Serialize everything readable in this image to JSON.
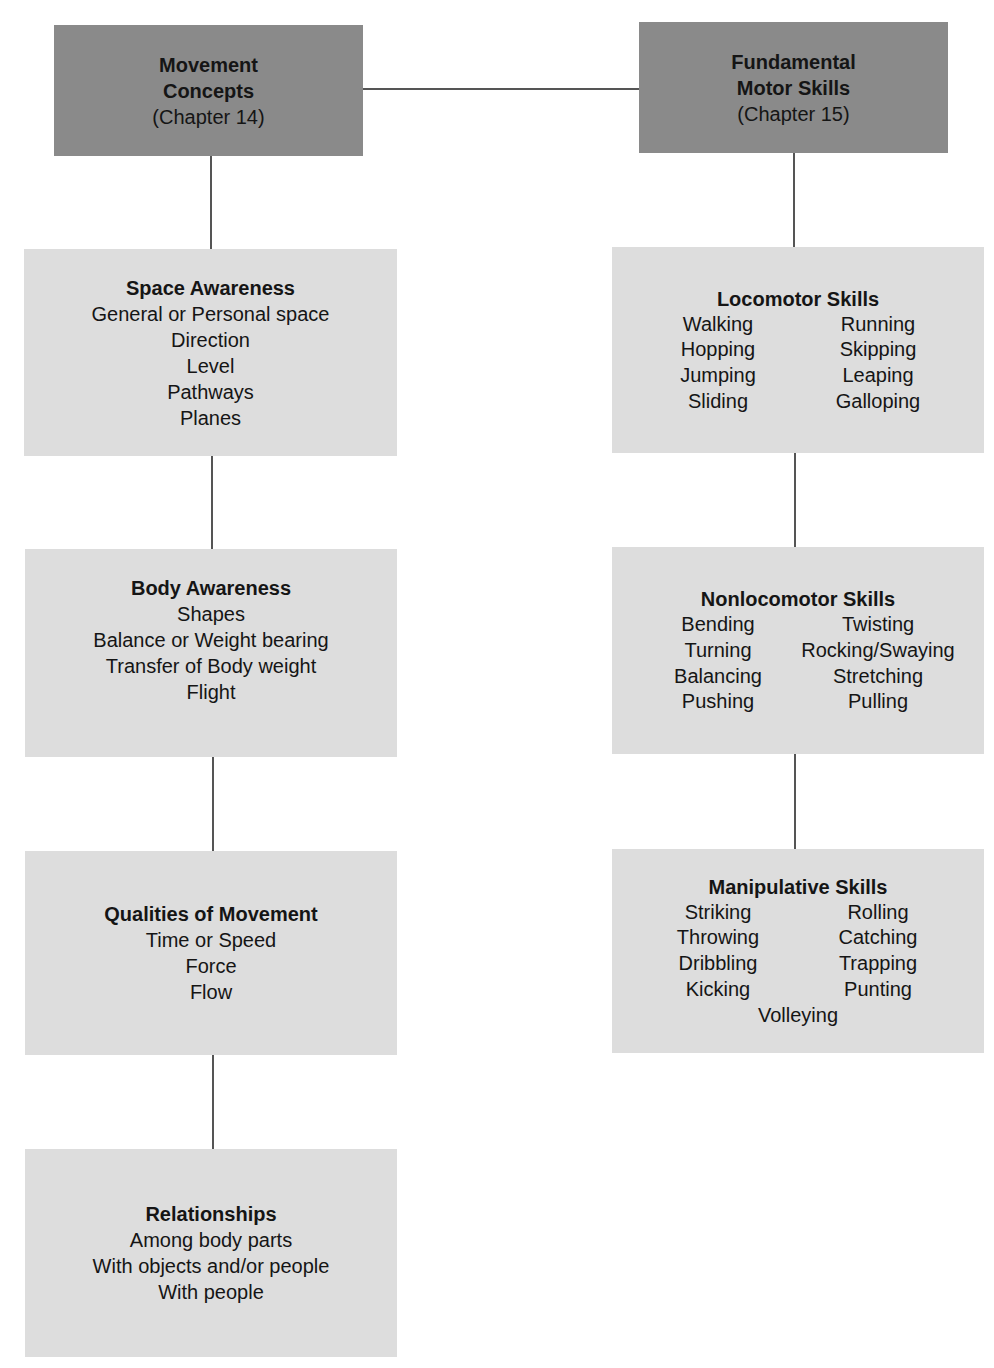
{
  "diagram": {
    "left_header": {
      "title_lines": [
        "Movement",
        "Concepts"
      ],
      "subtitle": "(Chapter 14)"
    },
    "right_header": {
      "title_lines": [
        "Fundamental",
        "Motor Skills"
      ],
      "subtitle": "(Chapter 15)"
    },
    "left_boxes": [
      {
        "title": "Space Awareness",
        "items": [
          "General or Personal space",
          "Direction",
          "Level",
          "Pathways",
          "Planes"
        ]
      },
      {
        "title": "Body Awareness",
        "items": [
          "Shapes",
          "Balance or Weight bearing",
          "Transfer of Body weight",
          "Flight"
        ]
      },
      {
        "title": "Qualities of Movement",
        "items": [
          "Time or Speed",
          "Force",
          "Flow"
        ]
      },
      {
        "title": "Relationships",
        "items": [
          "Among body parts",
          "With objects and/or people",
          "With people"
        ]
      }
    ],
    "right_boxes": [
      {
        "title": "Locomotor Skills",
        "rows": [
          [
            "Walking",
            "Running"
          ],
          [
            "Hopping",
            "Skipping"
          ],
          [
            "Jumping",
            "Leaping"
          ],
          [
            "Sliding",
            "Galloping"
          ]
        ],
        "extra": ""
      },
      {
        "title": "Nonlocomotor Skills",
        "rows": [
          [
            "Bending",
            "Twisting"
          ],
          [
            "Turning",
            "Rocking/Swaying"
          ],
          [
            "Balancing",
            "Stretching"
          ],
          [
            "Pushing",
            "Pulling"
          ]
        ],
        "extra": ""
      },
      {
        "title": "Manipulative Skills",
        "rows": [
          [
            "Striking",
            "Rolling"
          ],
          [
            "Throwing",
            "Catching"
          ],
          [
            "Dribbling",
            "Trapping"
          ],
          [
            "Kicking",
            "Punting"
          ]
        ],
        "extra": "Volleying"
      }
    ],
    "colors": {
      "header_fill": "#8a8a8a",
      "box_fill": "#dddddd",
      "connector": "#555555",
      "text": "#151515"
    }
  }
}
